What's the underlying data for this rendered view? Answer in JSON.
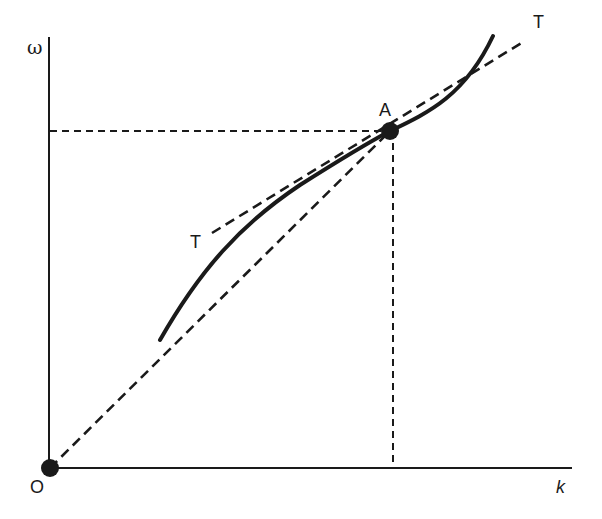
{
  "diagram": {
    "type": "economics-growth-diagram",
    "colors": {
      "line": "#1a1a1a",
      "background": "#ffffff"
    },
    "axes": {
      "y_label": "ω",
      "x_label": "k",
      "origin_label": "O"
    },
    "points": {
      "A": {
        "label": "A"
      },
      "O": {
        "label": "O"
      }
    },
    "tangent": {
      "label_lower": "T",
      "label_upper": "T"
    },
    "elements": [
      "solid curve ω(k) passing through A",
      "dashed tangent line T–T touching curve at A",
      "dashed ray from O through A",
      "dashed horizontal guide from A to ω-axis",
      "dashed vertical guide from A to k-axis"
    ]
  }
}
